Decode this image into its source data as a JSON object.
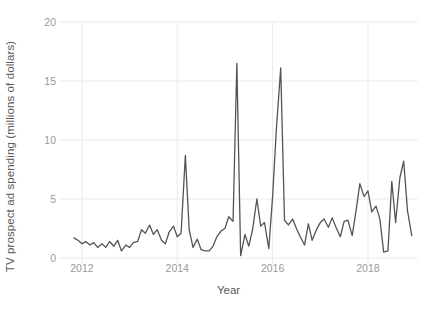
{
  "chart_data": {
    "type": "line",
    "title": "",
    "xlabel": "Year",
    "ylabel": "TV prospect ad spending (millions of dollars)",
    "xlim": [
      2011.75,
      2019.05
    ],
    "ylim": [
      0,
      20
    ],
    "grid": true,
    "legend": null,
    "line_color": "#545454",
    "grid_color": "#ebebeb",
    "tick_color": "#9a9a9a",
    "xticks": [
      2012,
      2014,
      2016,
      2018
    ],
    "xtick_labels": [
      "2012",
      "2014",
      "2016",
      "2018"
    ],
    "yticks": [
      0,
      5,
      10,
      15,
      20
    ],
    "ytick_labels": [
      "0",
      "5",
      "10",
      "15",
      "20"
    ],
    "series": [
      {
        "name": "TV prospect ad spending",
        "x": [
          2011.83,
          2011.92,
          2012.0,
          2012.08,
          2012.17,
          2012.25,
          2012.33,
          2012.42,
          2012.5,
          2012.58,
          2012.67,
          2012.75,
          2012.83,
          2012.92,
          2013.0,
          2013.08,
          2013.17,
          2013.25,
          2013.33,
          2013.42,
          2013.5,
          2013.58,
          2013.67,
          2013.75,
          2013.83,
          2013.92,
          2014.0,
          2014.08,
          2014.17,
          2014.25,
          2014.33,
          2014.42,
          2014.5,
          2014.58,
          2014.67,
          2014.75,
          2014.83,
          2014.92,
          2015.0,
          2015.08,
          2015.17,
          2015.25,
          2015.33,
          2015.42,
          2015.5,
          2015.58,
          2015.67,
          2015.75,
          2015.83,
          2015.92,
          2016.0,
          2016.08,
          2016.17,
          2016.25,
          2016.33,
          2016.42,
          2016.5,
          2016.58,
          2016.67,
          2016.75,
          2016.83,
          2016.92,
          2017.0,
          2017.08,
          2017.17,
          2017.25,
          2017.33,
          2017.42,
          2017.5,
          2017.58,
          2017.67,
          2017.75,
          2017.83,
          2017.92,
          2018.0,
          2018.08,
          2018.17,
          2018.25,
          2018.33,
          2018.42,
          2018.5,
          2018.58,
          2018.67,
          2018.75,
          2018.83,
          2018.92
        ],
        "values": [
          1.7,
          1.5,
          1.2,
          1.4,
          1.1,
          1.3,
          0.9,
          1.2,
          0.9,
          1.4,
          1.0,
          1.5,
          0.6,
          1.1,
          0.9,
          1.3,
          1.4,
          2.4,
          2.1,
          2.8,
          2.0,
          2.4,
          1.5,
          1.2,
          2.2,
          2.7,
          1.8,
          2.1,
          8.7,
          2.4,
          0.9,
          1.6,
          0.7,
          0.6,
          0.6,
          1.0,
          1.8,
          2.3,
          2.5,
          3.5,
          3.1,
          16.5,
          0.2,
          2.0,
          1.0,
          2.4,
          5.0,
          2.7,
          3.0,
          0.8,
          5.2,
          11.0,
          16.1,
          3.2,
          2.8,
          3.3,
          2.5,
          1.8,
          1.1,
          2.9,
          1.5,
          2.4,
          3.0,
          3.3,
          2.6,
          3.4,
          2.6,
          1.8,
          3.1,
          3.2,
          1.9,
          4.0,
          6.3,
          5.2,
          5.7,
          3.9,
          4.4,
          3.3,
          0.5,
          0.6,
          6.5,
          3.0,
          6.8,
          8.2,
          4.0,
          1.9
        ]
      }
    ]
  }
}
